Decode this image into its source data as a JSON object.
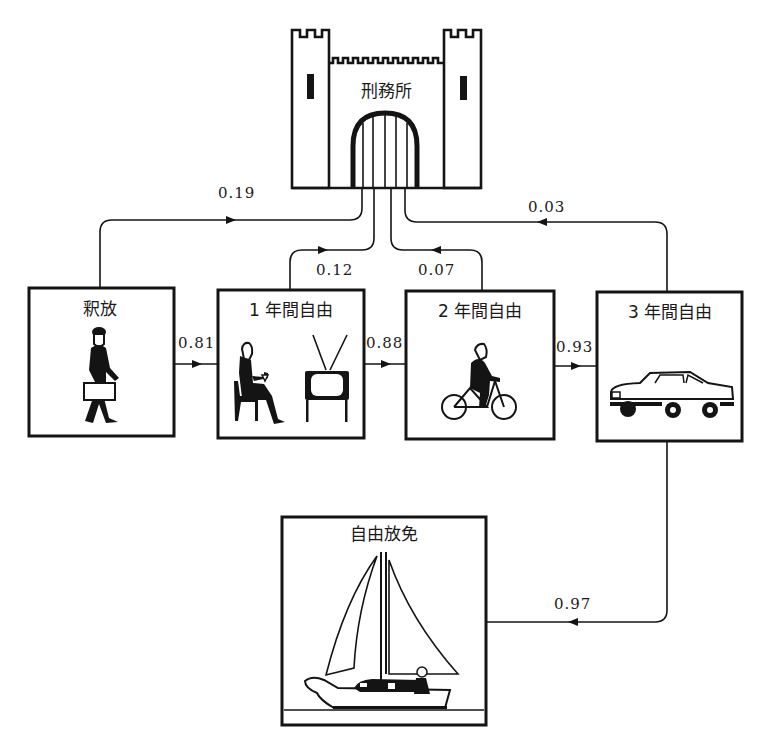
{
  "diagram": {
    "title": "",
    "type": "state-transition (Markov chain of parolee outcomes)",
    "nodes": {
      "prison": {
        "label": "刑務所",
        "icon": "castle-prison-icon"
      },
      "released": {
        "label": "釈放",
        "icon": "walking-man-with-briefcase-icon"
      },
      "free_1yr": {
        "label": "1 年間自由",
        "icon": "man-sitting-with-drink-and-tv-icon"
      },
      "free_2yr": {
        "label": "2 年間自由",
        "icon": "man-riding-bicycle-icon"
      },
      "free_3yr": {
        "label": "3 年間自由",
        "icon": "car-icon"
      },
      "discharged": {
        "label": "自由放免",
        "icon": "sailboat-icon"
      }
    },
    "edges": [
      {
        "from": "prison",
        "to": "released",
        "value": "0.19"
      },
      {
        "from": "released",
        "to": "free_1yr",
        "value": "0.81"
      },
      {
        "from": "free_1yr",
        "to": "prison",
        "value": "0.12"
      },
      {
        "from": "free_1yr",
        "to": "free_2yr",
        "value": "0.88"
      },
      {
        "from": "free_2yr",
        "to": "prison",
        "value": "0.07"
      },
      {
        "from": "free_2yr",
        "to": "free_3yr",
        "value": "0.93"
      },
      {
        "from": "free_3yr",
        "to": "prison",
        "value": "0.03"
      },
      {
        "from": "free_3yr",
        "to": "discharged",
        "value": "0.97"
      }
    ]
  }
}
